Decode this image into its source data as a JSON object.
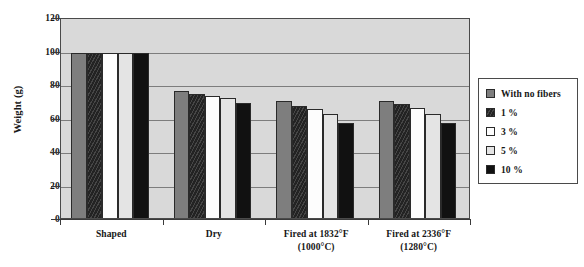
{
  "chart_data": {
    "type": "bar",
    "title": "",
    "xlabel": "",
    "ylabel": "Weight (g)",
    "ylim": [
      0,
      120
    ],
    "yticks": [
      0,
      20,
      40,
      60,
      80,
      100,
      120
    ],
    "ytick_labels": [
      "0",
      "20",
      "40",
      "60",
      "80",
      "100",
      "120"
    ],
    "grid": true,
    "legend_position": "right",
    "categories": [
      "Shaped",
      "Dry",
      "Fired at 1832°F",
      "Fired at 2336°F"
    ],
    "category_sublabels": [
      "",
      "",
      "(1000°C)",
      "(1280°C)"
    ],
    "series": [
      {
        "name": "With no fibers",
        "color": "#7e7e7e",
        "values": [
          100,
          77,
          71,
          71
        ]
      },
      {
        "name": "1 %",
        "color": "#232323",
        "values": [
          100,
          75,
          68,
          69
        ]
      },
      {
        "name": "3 %",
        "color": "#fdfdfd",
        "values": [
          100,
          74,
          66,
          67
        ]
      },
      {
        "name": "5 %",
        "color": "#e4e4e4",
        "values": [
          100,
          73,
          63,
          63
        ]
      },
      {
        "name": "10 %",
        "color": "#111111",
        "values": [
          100,
          70,
          58,
          58
        ]
      }
    ]
  },
  "legend": {
    "items": [
      {
        "label": "With no fibers",
        "swatch": "sw-nofiber"
      },
      {
        "label": "1 %",
        "swatch": "sw-1"
      },
      {
        "label": "3 %",
        "swatch": "sw-3"
      },
      {
        "label": "5 %",
        "swatch": "sw-5"
      },
      {
        "label": "10 %",
        "swatch": "sw-10"
      }
    ]
  }
}
